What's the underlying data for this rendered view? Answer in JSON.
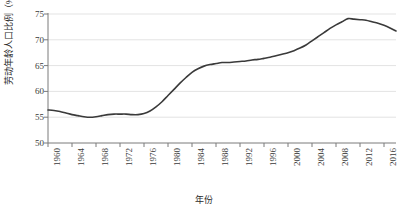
{
  "chart_data": {
    "type": "line",
    "title": "",
    "xlabel": "年份",
    "ylabel": "劳动年龄人口比例（%）",
    "ylim": [
      50,
      75
    ],
    "xlim": [
      1960,
      2018
    ],
    "yticks": [
      50,
      55,
      60,
      65,
      70,
      75
    ],
    "xticks": [
      1960,
      1964,
      1968,
      1972,
      1976,
      1980,
      1984,
      1988,
      1992,
      1996,
      2000,
      2004,
      2008,
      2012,
      2016
    ],
    "grid": "horizontal",
    "legend": "none",
    "line_color": "#3a3a3a",
    "series": [
      {
        "name": "劳动年龄人口比例",
        "x": [
          1960,
          1961,
          1962,
          1963,
          1964,
          1965,
          1966,
          1967,
          1968,
          1969,
          1970,
          1971,
          1972,
          1973,
          1974,
          1975,
          1976,
          1977,
          1978,
          1979,
          1980,
          1981,
          1982,
          1983,
          1984,
          1985,
          1986,
          1987,
          1988,
          1989,
          1990,
          1991,
          1992,
          1993,
          1994,
          1995,
          1996,
          1997,
          1998,
          1999,
          2000,
          2001,
          2002,
          2003,
          2004,
          2005,
          2006,
          2007,
          2008,
          2009,
          2010,
          2011,
          2012,
          2013,
          2014,
          2015,
          2016,
          2017,
          2018
        ],
        "values": [
          56.4,
          56.3,
          56.1,
          55.8,
          55.5,
          55.3,
          55.1,
          55.0,
          55.1,
          55.3,
          55.5,
          55.6,
          55.6,
          55.6,
          55.5,
          55.5,
          55.7,
          56.2,
          57.0,
          58.0,
          59.2,
          60.4,
          61.6,
          62.7,
          63.7,
          64.4,
          64.9,
          65.2,
          65.4,
          65.6,
          65.6,
          65.7,
          65.8,
          65.9,
          66.1,
          66.2,
          66.4,
          66.6,
          66.9,
          67.2,
          67.5,
          67.9,
          68.4,
          69.0,
          69.8,
          70.6,
          71.4,
          72.2,
          72.9,
          73.5,
          74.1,
          74.0,
          73.9,
          73.8,
          73.5,
          73.2,
          72.8,
          72.3,
          71.7
        ]
      }
    ]
  },
  "axes": {
    "y_title": "劳动年龄人口比例（%）",
    "x_title": "年份"
  }
}
